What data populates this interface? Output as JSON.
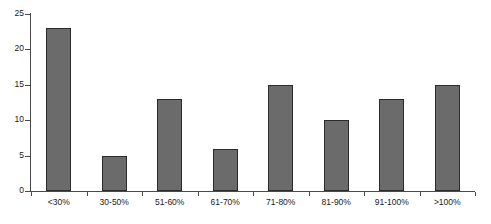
{
  "chart_data": {
    "type": "bar",
    "title": "",
    "subtitle": "",
    "xlabel": "",
    "ylabel": "",
    "categories": [
      "<30%",
      "30-50%",
      "51-60%",
      "61-70%",
      "71-80%",
      "81-90%",
      "91-100%",
      ">100%"
    ],
    "values": [
      23,
      5,
      13,
      6,
      15,
      10,
      13,
      15
    ],
    "ylim": [
      0,
      25
    ],
    "y_ticks": [
      0,
      5,
      10,
      15,
      20,
      25
    ],
    "y_tick_labels": [
      "0",
      "5",
      "10",
      "15",
      "20",
      "25"
    ],
    "grid": false,
    "legend": false,
    "legend_position": "none",
    "bar_fill_color": "#6b6b6b",
    "bar_border_color": "#2b2b2b",
    "axis_color": "#4a4a4a",
    "background_color": "#ffffff",
    "text_color": "#1a1a1a"
  }
}
